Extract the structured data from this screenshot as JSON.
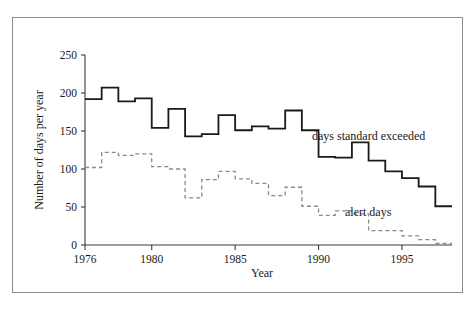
{
  "figure": {
    "border_color": "#8b8b8b",
    "background": "#ffffff"
  },
  "axes": {
    "xlabel": "Year",
    "ylabel": "Number of days per year",
    "ytick_labels": [
      "0",
      "50",
      "100",
      "150",
      "200",
      "250"
    ],
    "xtick_labels": [
      "1976",
      "1980",
      "1985",
      "1990",
      "1995"
    ]
  },
  "annotations": {
    "solid_label": "days standard exceeded",
    "dashed_label": "alert days"
  },
  "chart_data": {
    "type": "line",
    "subtype": "step",
    "title": "",
    "xlabel": "Year",
    "ylabel": "Number of days per year",
    "xlim": [
      1976,
      1998
    ],
    "ylim": [
      0,
      250
    ],
    "xticks": [
      1976,
      1980,
      1985,
      1990,
      1995
    ],
    "yticks": [
      0,
      50,
      100,
      150,
      200,
      250
    ],
    "grid": false,
    "legend": "inline-annotations",
    "x": [
      1976,
      1977,
      1978,
      1979,
      1980,
      1981,
      1982,
      1983,
      1984,
      1985,
      1986,
      1987,
      1988,
      1989,
      1990,
      1991,
      1992,
      1993,
      1994,
      1995,
      1996,
      1997
    ],
    "series": [
      {
        "name": "days standard exceeded",
        "style": "solid",
        "color": "#1a1a1a",
        "values": [
          192,
          207,
          189,
          193,
          154,
          179,
          143,
          146,
          171,
          151,
          156,
          153,
          177,
          151,
          116,
          115,
          135,
          111,
          97,
          88,
          77,
          51
        ]
      },
      {
        "name": "alert days",
        "style": "dashed",
        "color": "#8a8a8a",
        "values": [
          102,
          122,
          118,
          120,
          103,
          100,
          62,
          86,
          97,
          87,
          81,
          65,
          76,
          51,
          39,
          45,
          41,
          19,
          19,
          12,
          7,
          2
        ]
      }
    ]
  }
}
